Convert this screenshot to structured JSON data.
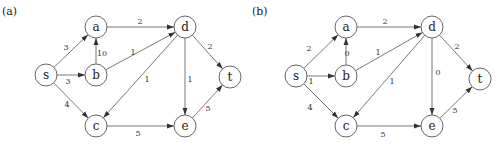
{
  "panels": [
    {
      "label": "(a)",
      "nodes": [
        "s",
        "a",
        "b",
        "c",
        "d",
        "e",
        "t"
      ],
      "edges": [
        {
          "from": "s",
          "to": "a",
          "weight": "3"
        },
        {
          "from": "s",
          "to": "b",
          "weight": "3"
        },
        {
          "from": "s",
          "to": "c",
          "weight": "4"
        },
        {
          "from": "b",
          "to": "a",
          "weight": "10"
        },
        {
          "from": "a",
          "to": "d",
          "weight": "2"
        },
        {
          "from": "b",
          "to": "d",
          "weight": "1"
        },
        {
          "from": "d",
          "to": "c",
          "weight": "1"
        },
        {
          "from": "d",
          "to": "e",
          "weight": "1"
        },
        {
          "from": "d",
          "to": "t",
          "weight": "2"
        },
        {
          "from": "c",
          "to": "e",
          "weight": "5"
        },
        {
          "from": "e",
          "to": "t",
          "weight": "5"
        }
      ]
    },
    {
      "label": "(b)",
      "nodes": [
        "s",
        "a",
        "b",
        "c",
        "d",
        "e",
        "t"
      ],
      "edges": [
        {
          "from": "s",
          "to": "a",
          "weight": "2"
        },
        {
          "from": "s",
          "to": "b",
          "weight": "1"
        },
        {
          "from": "s",
          "to": "c",
          "weight": "4"
        },
        {
          "from": "b",
          "to": "a",
          "weight": "0"
        },
        {
          "from": "a",
          "to": "d",
          "weight": "2"
        },
        {
          "from": "b",
          "to": "d",
          "weight": "1"
        },
        {
          "from": "d",
          "to": "c",
          "weight": "1"
        },
        {
          "from": "d",
          "to": "e",
          "weight": "0"
        },
        {
          "from": "d",
          "to": "t",
          "weight": "2"
        },
        {
          "from": "c",
          "to": "e",
          "weight": "5"
        },
        {
          "from": "e",
          "to": "t",
          "weight": "5"
        }
      ]
    }
  ]
}
